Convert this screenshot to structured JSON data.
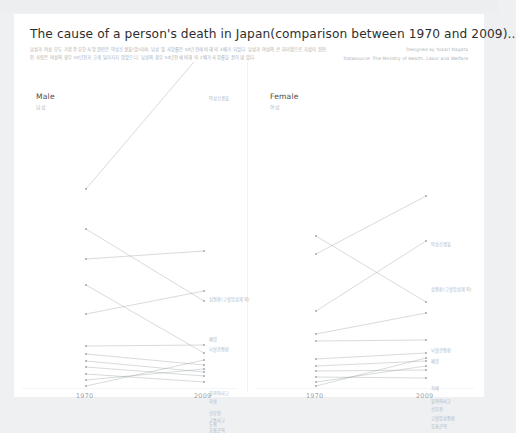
{
  "topbar": {
    "ghost_text": ""
  },
  "header": {
    "title": "The cause of a person's death in  Japan(comparison between 1970 and 2009)..",
    "subtitle": "남성과 여성 모두 가장 주요한 사망 원인은 악성신생물(암)이며, 남성 및 사망률은 50년전에 비해 약 3배가 되었다. 남성과 여성의 큰 차이점으로 자살이 원인인 사람은 여성의 경우 50년전과 크게 달라지지 않았으나, 남성의 경우 50년전에 비해 약 2배가 사망률을 끌어 낼 있다.",
    "credit_designer": "Designed by Yukari Nagata",
    "credit_source": "Datasource: The Ministry of Health, Labor and Welfare"
  },
  "axis": {
    "left_year": "1970",
    "right_year": "2009"
  },
  "panels": [
    {
      "id": "male",
      "title_en": "Male",
      "title_ko": "남성",
      "series": [
        {
          "label": "악성신생물",
          "left": 175,
          "right": 36
        },
        {
          "label": "심질환(고혈압성제외)",
          "left": 245,
          "right": 237
        },
        {
          "label": "뇌혈관질환",
          "left": 215,
          "right": 287
        },
        {
          "label": "폐염",
          "left": 300,
          "right": 277
        },
        {
          "label": "불의의사고",
          "left": 332,
          "right": 331
        },
        {
          "label": "자살",
          "left": 271,
          "right": 339
        },
        {
          "label": "신부전",
          "left": 340,
          "right": 351
        },
        {
          "label": "교통사고",
          "left": 347,
          "right": 358
        },
        {
          "label": "노쇠",
          "left": 353,
          "right": 362
        },
        {
          "label": "호흡곤역",
          "left": 360,
          "right": 368
        },
        {
          "label": "",
          "left": 366,
          "right": 355
        },
        {
          "label": "",
          "left": 372,
          "right": 346
        }
      ]
    },
    {
      "id": "female",
      "title_en": "Female",
      "title_ko": "여성",
      "series": [
        {
          "label": "악성신생물",
          "left": 240,
          "right": 182
        },
        {
          "label": "심질환(고혈압성제외)",
          "left": 297,
          "right": 227
        },
        {
          "label": "뇌혈관질환",
          "left": 222,
          "right": 288
        },
        {
          "label": "폐염",
          "left": 320,
          "right": 299
        },
        {
          "label": "치매",
          "left": 327,
          "right": 326
        },
        {
          "label": "불의의사고",
          "left": 345,
          "right": 339
        },
        {
          "label": "신부전",
          "left": 352,
          "right": 347
        },
        {
          "label": "고혈압성질환",
          "left": 357,
          "right": 356
        },
        {
          "label": "호흡곤역",
          "left": 363,
          "right": 364
        },
        {
          "label": "",
          "left": 368,
          "right": 352
        },
        {
          "label": "",
          "left": 372,
          "right": 344
        }
      ]
    }
  ],
  "chart_data": {
    "type": "line",
    "title": "The cause of a person's death in  Japan(comparison between 1970 and 2009)..",
    "xlabel": "",
    "ylabel": "",
    "x": [
      "1970",
      "2009"
    ],
    "grid": false,
    "legend": "none",
    "note": "Slopegraph: two panels (Male / Female). Each line connects a cause of death's rank/rate in 1970 to 2009. Values are plotted positions in screen pixels (lower y = higher rate).",
    "panels": [
      {
        "name": "Male (남성)",
        "series": [
          {
            "name": "악성신생물",
            "values": [
              175,
              36
            ]
          },
          {
            "name": "심질환(고혈압성제외)",
            "values": [
              245,
              237
            ]
          },
          {
            "name": "뇌혈관질환",
            "values": [
              215,
              287
            ]
          },
          {
            "name": "폐염",
            "values": [
              300,
              277
            ]
          },
          {
            "name": "불의의사고",
            "values": [
              332,
              331
            ]
          },
          {
            "name": "자살",
            "values": [
              271,
              339
            ]
          },
          {
            "name": "신부전",
            "values": [
              340,
              351
            ]
          },
          {
            "name": "교통사고",
            "values": [
              347,
              358
            ]
          },
          {
            "name": "노쇠",
            "values": [
              353,
              362
            ]
          },
          {
            "name": "호흡곤역",
            "values": [
              360,
              368
            ]
          }
        ]
      },
      {
        "name": "Female (여성)",
        "series": [
          {
            "name": "악성신생물",
            "values": [
              240,
              182
            ]
          },
          {
            "name": "심질환(고혈압성제외)",
            "values": [
              297,
              227
            ]
          },
          {
            "name": "뇌혈관질환",
            "values": [
              222,
              288
            ]
          },
          {
            "name": "폐염",
            "values": [
              320,
              299
            ]
          },
          {
            "name": "치매",
            "values": [
              327,
              326
            ]
          },
          {
            "name": "불의의사고",
            "values": [
              345,
              339
            ]
          },
          {
            "name": "신부전",
            "values": [
              352,
              347
            ]
          },
          {
            "name": "고혈압성질환",
            "values": [
              357,
              356
            ]
          },
          {
            "name": "호흡곤역",
            "values": [
              363,
              364
            ]
          }
        ]
      }
    ]
  },
  "colors": {
    "line": "#9aa0a6",
    "label": "#b0b4b8",
    "title": "#2e2e2e",
    "panel_bg": "#ffffff",
    "page_bg": "#eef0f2"
  }
}
